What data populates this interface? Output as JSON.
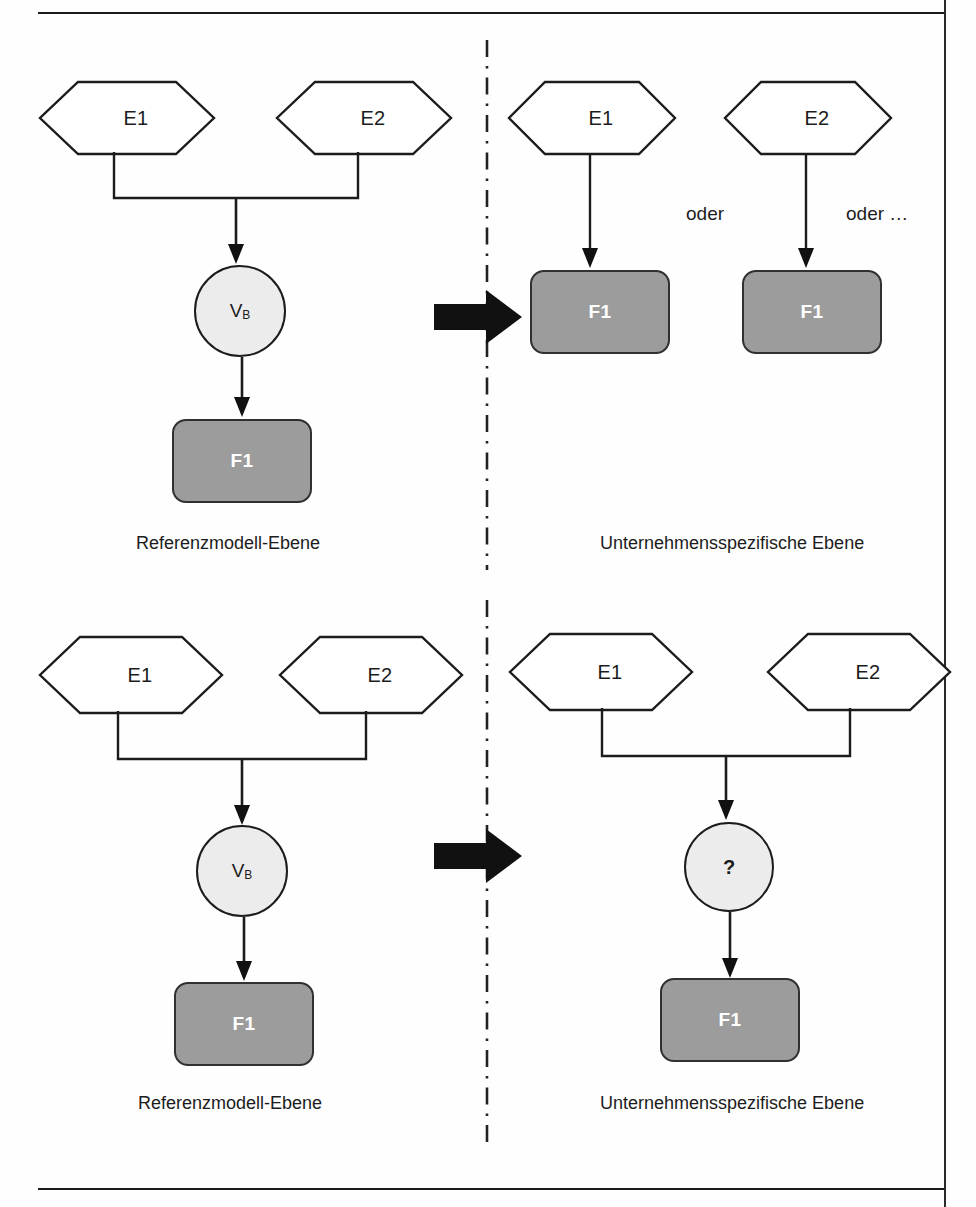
{
  "page": {
    "header_sliver_text": "Abbildung: Konfiguration",
    "background_color": "#fefefe",
    "frame_color": "#1b1b1b"
  },
  "colors": {
    "function_box_fill": "#9c9c9c",
    "function_box_border": "#303030",
    "function_box_text": "#ffffff",
    "circle_fill": "#ececec",
    "circle_border": "#1c1c1c",
    "hexagon_fill": "#ffffff",
    "hexagon_border": "#1c1c1c",
    "connector": "#1c1c1c",
    "block_arrow": "#111111",
    "divider": "#222222",
    "text": "#1c1c1c"
  },
  "divider": {
    "name": "vertical-dash-dot-divider",
    "style": "dash-dot"
  },
  "top_panel": {
    "left_side": {
      "caption": "Referenzmodell-Ebene",
      "entities": [
        {
          "label": "E1"
        },
        {
          "label": "E2"
        }
      ],
      "operator": {
        "label": "V",
        "subscript": "B"
      },
      "function": {
        "label": "F1"
      }
    },
    "right_side": {
      "caption": "Unternehmensspezifische Ebene",
      "variants": [
        {
          "entity": "E1",
          "function": "F1"
        },
        {
          "entity": "E2",
          "function": "F1"
        }
      ],
      "connector_label_1": "oder",
      "connector_label_2": "oder …"
    },
    "transition_arrow": "block-arrow-right"
  },
  "bottom_panel": {
    "left_side": {
      "caption": "Referenzmodell-Ebene",
      "entities": [
        {
          "label": "E1"
        },
        {
          "label": "E2"
        }
      ],
      "operator": {
        "label": "V",
        "subscript": "B"
      },
      "function": {
        "label": "F1"
      }
    },
    "right_side": {
      "caption": "Unternehmensspezifische Ebene",
      "entities": [
        {
          "label": "E1"
        },
        {
          "label": "E2"
        }
      ],
      "operator": {
        "label": "?",
        "subscript": ""
      },
      "function": {
        "label": "F1"
      }
    },
    "transition_arrow": "block-arrow-right"
  }
}
